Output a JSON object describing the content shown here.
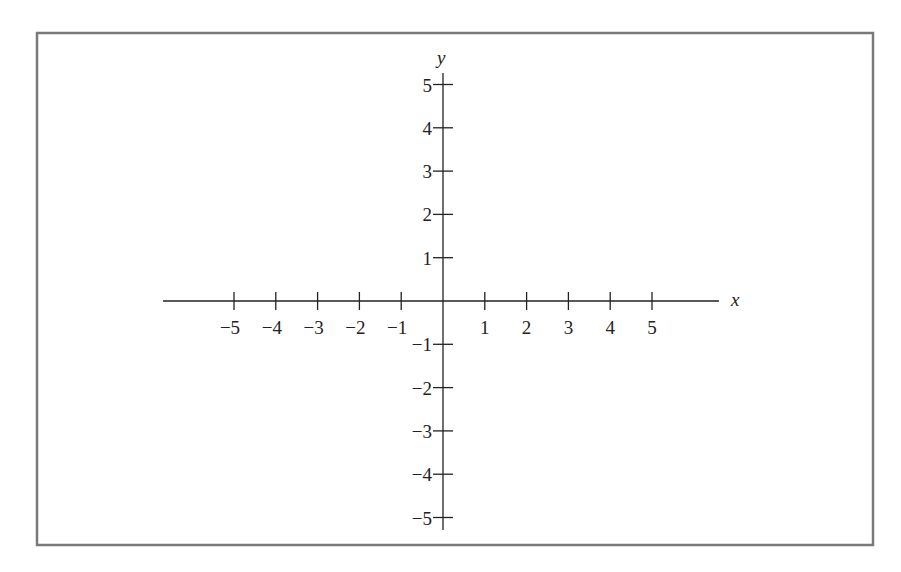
{
  "figure": {
    "frame_color": "#7a7a7a",
    "axis_color": "#222222"
  },
  "axes": {
    "x": {
      "label": "x",
      "ticks": [
        -5,
        -4,
        -3,
        -2,
        -1,
        1,
        2,
        3,
        4,
        5
      ],
      "tick_labels": [
        "−5",
        "−4",
        "−3",
        "−2",
        "−1",
        "1",
        "2",
        "3",
        "4",
        "5"
      ]
    },
    "y": {
      "label": "y",
      "ticks": [
        5,
        4,
        3,
        2,
        1,
        -1,
        -2,
        -3,
        -4,
        -5
      ],
      "tick_labels": [
        "5",
        "4",
        "3",
        "2",
        "1",
        "−1",
        "−2",
        "−3",
        "−4",
        "−5"
      ]
    }
  },
  "chart_data": {
    "type": "scatter",
    "title": "",
    "xlabel": "x",
    "ylabel": "y",
    "xlim": [
      -6.5,
      6.5
    ],
    "ylim": [
      -5.5,
      5.5
    ],
    "xticks": [
      -5,
      -4,
      -3,
      -2,
      -1,
      1,
      2,
      3,
      4,
      5
    ],
    "yticks": [
      -5,
      -4,
      -3,
      -2,
      -1,
      1,
      2,
      3,
      4,
      5
    ],
    "grid": false,
    "series": [],
    "annotations": [
      "Empty coordinate plane with origin at center"
    ]
  }
}
